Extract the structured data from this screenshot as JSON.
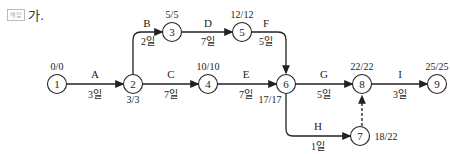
{
  "header": {
    "badge": "해답",
    "title": "가."
  },
  "nodes": [
    {
      "id": "1",
      "label": "1",
      "times": "0/0"
    },
    {
      "id": "2",
      "label": "2",
      "times": "3/3"
    },
    {
      "id": "3",
      "label": "3",
      "times": "5/5"
    },
    {
      "id": "4",
      "label": "4",
      "times": "10/10"
    },
    {
      "id": "5",
      "label": "5",
      "times": "12/12"
    },
    {
      "id": "6",
      "label": "6",
      "times": "17/17"
    },
    {
      "id": "7",
      "label": "7",
      "times": "18/22"
    },
    {
      "id": "8",
      "label": "8",
      "times": "22/22"
    },
    {
      "id": "9",
      "label": "9",
      "times": "25/25"
    }
  ],
  "edges": [
    {
      "name": "A",
      "duration": "3일",
      "from": "1",
      "to": "2"
    },
    {
      "name": "B",
      "duration": "2일",
      "from": "2",
      "to": "3"
    },
    {
      "name": "C",
      "duration": "7일",
      "from": "2",
      "to": "4"
    },
    {
      "name": "D",
      "duration": "7일",
      "from": "3",
      "to": "5"
    },
    {
      "name": "E",
      "duration": "7일",
      "from": "4",
      "to": "6"
    },
    {
      "name": "F",
      "duration": "5일",
      "from": "5",
      "to": "6"
    },
    {
      "name": "G",
      "duration": "5일",
      "from": "6",
      "to": "8"
    },
    {
      "name": "H",
      "duration": "1일",
      "from": "6",
      "to": "7"
    },
    {
      "name": "I",
      "duration": "3일",
      "from": "8",
      "to": "9"
    },
    {
      "name": "dummy",
      "duration": "",
      "from": "7",
      "to": "8",
      "style": "dashed"
    }
  ]
}
